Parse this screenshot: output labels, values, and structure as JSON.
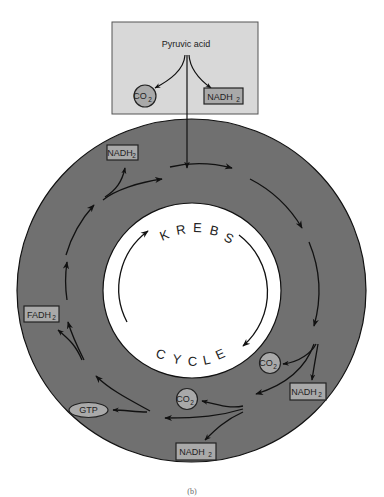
{
  "colors": {
    "ring": "#707070",
    "box_fill": "#a9a9a9",
    "top_box_fill": "#d8d8d8",
    "line": "#111111",
    "inner": "#ffffff"
  },
  "top_box": {
    "title": "Pyruvic acid",
    "co2": {
      "text": "CO",
      "sub": "2"
    },
    "nadh2": {
      "text": "NADH",
      "sub": "2"
    }
  },
  "center": {
    "word_top": "KREBS",
    "word_bottom": "CYCLE",
    "letters_top": [
      "K",
      "R",
      "E",
      "B",
      "S"
    ],
    "letters_bottom": [
      "C",
      "Y",
      "C",
      "L",
      "E"
    ]
  },
  "products": [
    {
      "id": "nadh2-upper-left",
      "type": "box",
      "text": "NADH",
      "sub": "2"
    },
    {
      "id": "fadh2-left",
      "type": "box",
      "text": "FADH",
      "sub": "2"
    },
    {
      "id": "gtp-left",
      "type": "ellipse",
      "text": "GTP",
      "sub": ""
    },
    {
      "id": "co2-lower-middle",
      "type": "circle",
      "text": "CO",
      "sub": "2"
    },
    {
      "id": "nadh2-bottom",
      "type": "box",
      "text": "NADH",
      "sub": "2"
    },
    {
      "id": "co2-right",
      "type": "circle",
      "text": "CO",
      "sub": "2"
    },
    {
      "id": "nadh2-right",
      "type": "box",
      "text": "NADH",
      "sub": "2"
    }
  ],
  "caption": "(b)"
}
